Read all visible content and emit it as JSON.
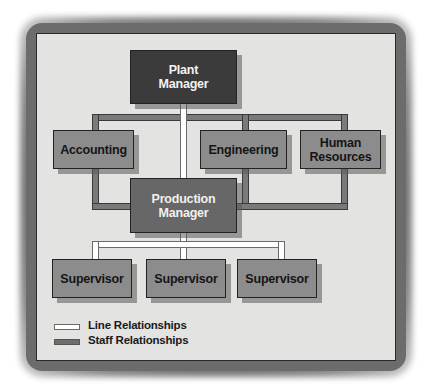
{
  "diagram": {
    "type": "organization-chart",
    "nodes": {
      "plant_manager": "Plant\nManager",
      "accounting": "Accounting",
      "engineering": "Engineering",
      "human_resources": "Human\nResources",
      "production_manager": "Production\nManager",
      "supervisor_1": "Supervisor",
      "supervisor_2": "Supervisor",
      "supervisor_3": "Supervisor"
    },
    "edges": [
      {
        "from": "Plant Manager",
        "to": "Production Manager",
        "type": "line"
      },
      {
        "from": "Plant Manager",
        "to": "Accounting",
        "type": "staff"
      },
      {
        "from": "Plant Manager",
        "to": "Engineering",
        "type": "staff"
      },
      {
        "from": "Plant Manager",
        "to": "Human Resources",
        "type": "staff"
      },
      {
        "from": "Accounting",
        "to": "Production Manager",
        "type": "staff"
      },
      {
        "from": "Engineering",
        "to": "Production Manager",
        "type": "staff"
      },
      {
        "from": "Human Resources",
        "to": "Production Manager",
        "type": "staff"
      },
      {
        "from": "Production Manager",
        "to": "Supervisor",
        "type": "line"
      },
      {
        "from": "Production Manager",
        "to": "Supervisor",
        "type": "line"
      },
      {
        "from": "Production Manager",
        "to": "Supervisor",
        "type": "line"
      }
    ],
    "legend": {
      "line": "Line Relationships",
      "staff": "Staff Relationships"
    },
    "colors": {
      "plant_manager": "#3b3b3b",
      "production_manager": "#676767",
      "staff_units": "#8c8c8c",
      "staff_line": "#7a7a7a",
      "line_relationship": "#ffffff",
      "panel_background": "#e3e3e1"
    }
  }
}
